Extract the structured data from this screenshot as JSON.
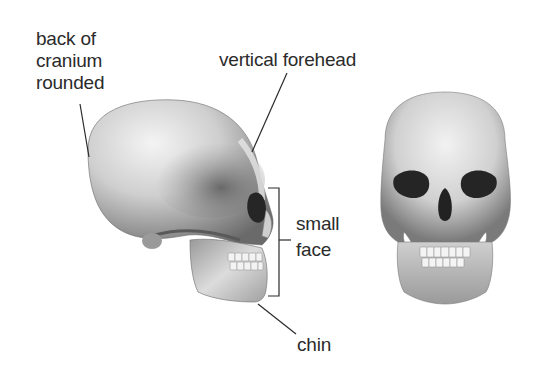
{
  "figure": {
    "labels": {
      "back_of_cranium": [
        "back of",
        "cranium",
        "rounded"
      ],
      "forehead": "vertical forehead",
      "face": [
        "small",
        "face"
      ],
      "chin": "chin"
    },
    "views": [
      {
        "name": "lateral view"
      },
      {
        "name": "frontal view"
      }
    ],
    "colors": {
      "ink": "#2b2b2b",
      "bone_light": "#eeeeee",
      "bone_mid": "#b5b5b5",
      "bone_dark": "#5a5a5a",
      "cavity": "#1e1e1e"
    }
  }
}
